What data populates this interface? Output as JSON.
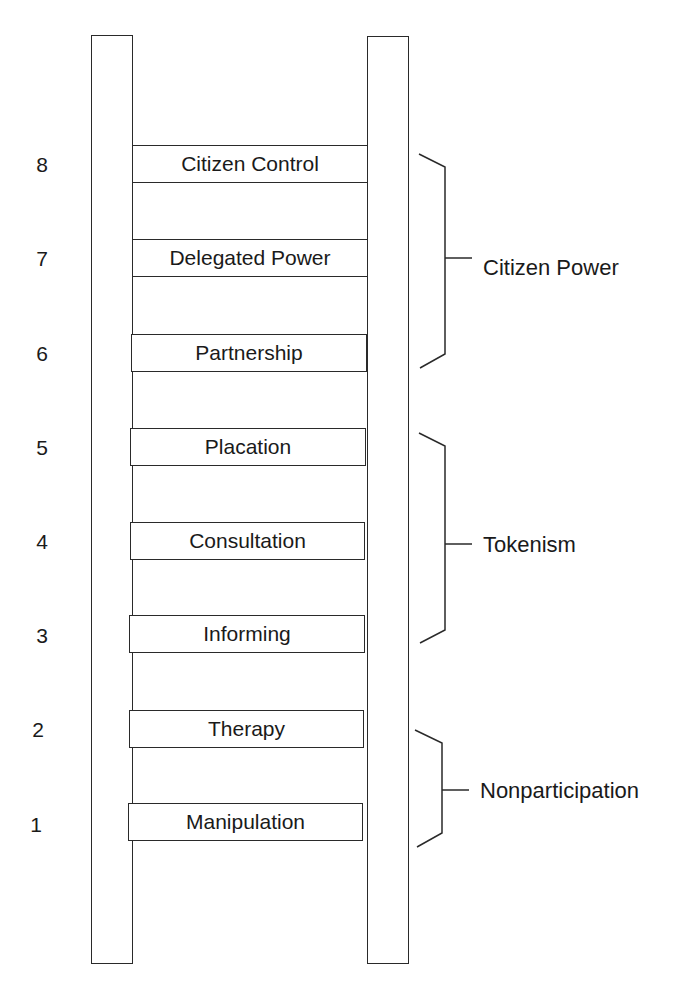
{
  "diagram": {
    "type": "ladder",
    "rungs": [
      {
        "level": "8",
        "label": "Citizen Control"
      },
      {
        "level": "7",
        "label": "Delegated Power"
      },
      {
        "level": "6",
        "label": "Partnership"
      },
      {
        "level": "5",
        "label": "Placation"
      },
      {
        "level": "4",
        "label": "Consultation"
      },
      {
        "level": "3",
        "label": "Informing"
      },
      {
        "level": "2",
        "label": "Therapy"
      },
      {
        "level": "1",
        "label": "Manipulation"
      }
    ],
    "groups": [
      {
        "label": "Citizen Power",
        "levels": [
          "8",
          "7",
          "6"
        ]
      },
      {
        "label": "Tokenism",
        "levels": [
          "5",
          "4",
          "3"
        ]
      },
      {
        "label": "Nonparticipation",
        "levels": [
          "2",
          "1"
        ]
      }
    ]
  }
}
